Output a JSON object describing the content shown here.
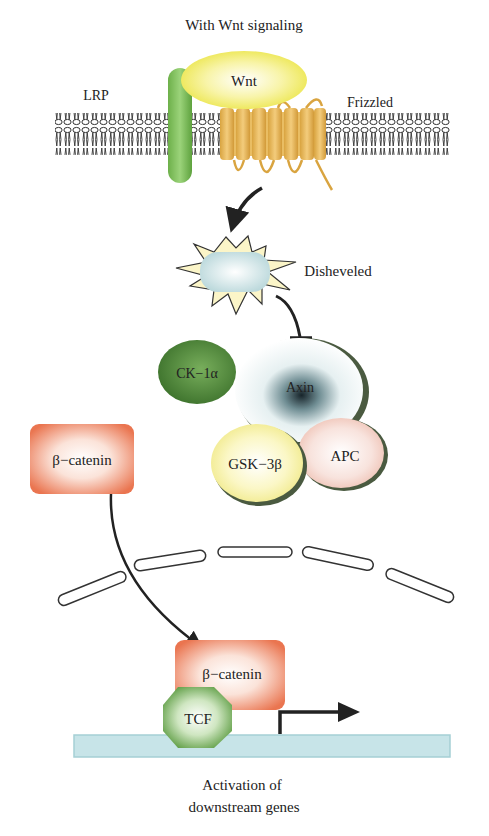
{
  "title": "With Wnt signaling",
  "membrane": {
    "lrp_label": "LRP",
    "wnt_label": "Wnt",
    "frizzled_label": "Frizzled"
  },
  "cytoplasm": {
    "disheveled_label": "Disheveled",
    "ck1a_label": "CK−1α",
    "axin_label": "Axin",
    "gsk3b_label": "GSK−3β",
    "apc_label": "APC",
    "beta_catenin_label": "β−catenin"
  },
  "nucleus": {
    "beta_catenin_label": "β−catenin",
    "tcf_label": "TCF"
  },
  "caption": {
    "line1": "Activation of",
    "line2": "downstream genes"
  },
  "colors": {
    "lrp": "#7cbf5a",
    "wnt": "#f2ee7a",
    "frizzled": "#e3b55a",
    "disheveled": "#d6e8ea",
    "ck1a": "#4f8a3a",
    "axin_center": "#1d2a2f",
    "gsk3b": "#f6f2a6",
    "apc": "#f2cfc6",
    "beta_catenin": "#ec7d5a",
    "tcf": "#6aa84f",
    "dna": "#bfe0e4"
  }
}
